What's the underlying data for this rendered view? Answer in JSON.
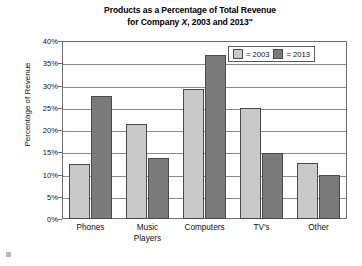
{
  "chart_data": {
    "type": "bar",
    "title": "Products as a Percentage of Total Revenue for Company X, 2003 and 2013\"",
    "title_line1": "Products as a Percentage of Total Revenue",
    "title_line2_pre": "for Company ",
    "title_line2_italic": "X",
    "title_line2_post": ", 2003 and 2013\"",
    "xlabel": "",
    "ylabel": "Percentage of Revenue",
    "categories": [
      "Phones",
      "Music Players",
      "Computers",
      "TV's",
      "Other"
    ],
    "category_lines": [
      [
        "Phones"
      ],
      [
        "Music",
        "Players"
      ],
      [
        "Computers"
      ],
      [
        "TV's"
      ],
      [
        "Other"
      ]
    ],
    "series": [
      {
        "name": "2003",
        "legend_label": "= 2003",
        "color": "#c9c9c9",
        "values": [
          12.3,
          21.4,
          29.3,
          25.0,
          12.7
        ]
      },
      {
        "name": "2013",
        "legend_label": "= 2013",
        "color": "#7a7a7a",
        "values": [
          27.7,
          13.8,
          36.8,
          14.8,
          10.0
        ]
      }
    ],
    "ylim": [
      0,
      40
    ],
    "ytick_values": [
      0,
      5,
      10,
      15,
      20,
      25,
      30,
      35,
      40
    ],
    "ytick_labels": [
      "0%",
      "5%",
      "10%",
      "15%",
      "20%",
      "25%",
      "30%",
      "35%",
      "40%"
    ],
    "grid": true,
    "legend_position": "top-right"
  }
}
